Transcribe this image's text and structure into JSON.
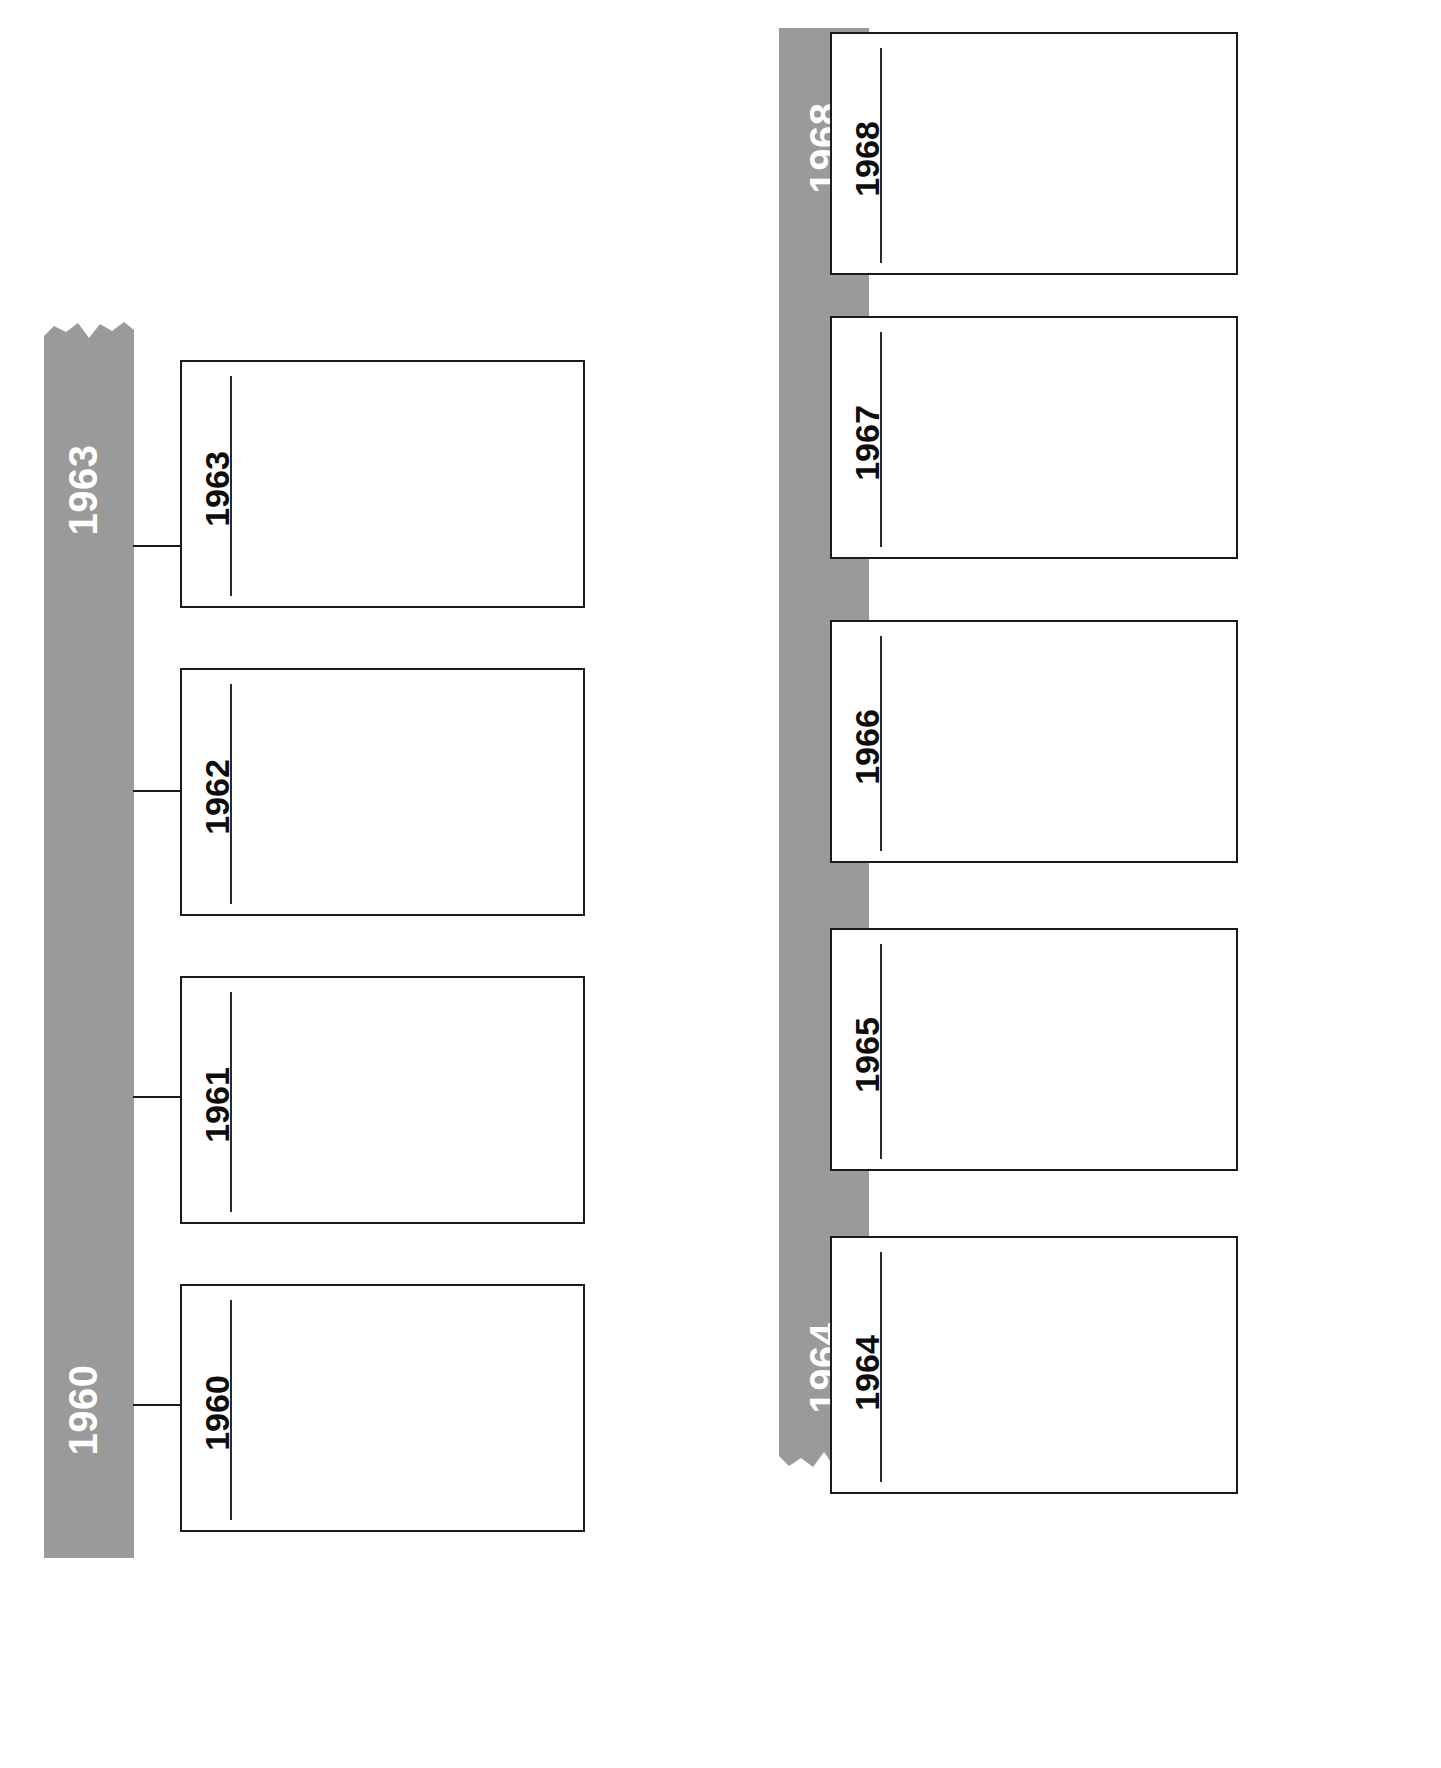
{
  "document": {
    "type": "timeline-worksheet",
    "orientation": "vertical-rotated",
    "title": "",
    "background_color": "#ffffff"
  },
  "palette": {
    "spine_gray": "#9a9a9a",
    "spine_label_color": "#ffffff",
    "card_border": "#1a1a1a",
    "card_label_color": "#0d0d0d",
    "card_rule_color": "#2b2b2b",
    "connector_color": "#1a1a1a",
    "card_fill": "#ffffff"
  },
  "timelines": [
    {
      "id": "timeline-left",
      "name": "left-timeline",
      "start_label": "1960",
      "end_label": "1963",
      "torn_edge": "top",
      "events": [
        {
          "year": "1963",
          "body": ""
        },
        {
          "year": "1962",
          "body": ""
        },
        {
          "year": "1961",
          "body": ""
        },
        {
          "year": "1960",
          "body": ""
        }
      ]
    },
    {
      "id": "timeline-right",
      "name": "right-timeline",
      "start_label": "1964",
      "end_label": "1968",
      "torn_edge": "bottom",
      "events": [
        {
          "year": "1968",
          "body": ""
        },
        {
          "year": "1967",
          "body": ""
        },
        {
          "year": "1966",
          "body": ""
        },
        {
          "year": "1965",
          "body": ""
        },
        {
          "year": "1964",
          "body": ""
        }
      ]
    }
  ]
}
